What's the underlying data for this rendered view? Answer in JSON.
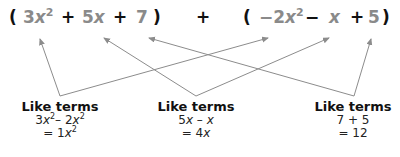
{
  "expression": {
    "group1": {
      "open": "(",
      "t1_coef": "3",
      "t1_var": "x",
      "t1_exp": "2",
      "op1": "+",
      "t2_coef": "5",
      "t2_var": "x",
      "op2": "+",
      "t3": "7",
      "close": ")"
    },
    "middle_op": "+",
    "group2": {
      "open": "(",
      "t1_coef": "−2",
      "t1_var": "x",
      "t1_exp": "2",
      "op1": "−",
      "t2_var": "x",
      "op2": "+",
      "t3": "5",
      "close": ")"
    }
  },
  "groups": [
    {
      "title": "Like terms",
      "line1": {
        "a_coef": "3",
        "a_var": "x",
        "a_exp": "2",
        "op": "– ",
        "b_coef": "2",
        "b_var": "x",
        "b_exp": "2"
      },
      "line2": {
        "prefix": "= 1",
        "var": "x",
        "exp": "2"
      }
    },
    {
      "title": "Like terms",
      "line1": {
        "a_coef": "5",
        "a_var": "x",
        "op": " – ",
        "b_var": "x"
      },
      "line2": {
        "prefix": "= 4",
        "var": "x"
      }
    },
    {
      "title": "Like terms",
      "line1": {
        "text": "7 + 5"
      },
      "line2": {
        "text": "= 12"
      }
    }
  ],
  "colors": {
    "terms": "#8a8a8a",
    "operators": "#111111",
    "arrows": "#8c8c8c"
  }
}
